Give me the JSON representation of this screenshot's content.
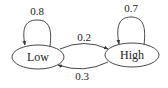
{
  "diagram": {
    "type": "state-transition",
    "nodes": [
      {
        "id": "low",
        "label": "Low"
      },
      {
        "id": "high",
        "label": "High"
      }
    ],
    "edges": [
      {
        "from": "Low",
        "to": "Low",
        "label": "0.8"
      },
      {
        "from": "Low",
        "to": "High",
        "label": "0.2"
      },
      {
        "from": "High",
        "to": "Low",
        "label": "0.3"
      },
      {
        "from": "High",
        "to": "High",
        "label": "0.7"
      }
    ],
    "colors": {
      "stroke": "#333333",
      "text": "#222222",
      "background": "#ffffff"
    }
  }
}
